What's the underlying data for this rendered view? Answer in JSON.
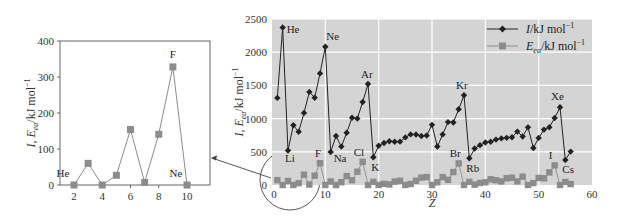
{
  "chart_data": [
    {
      "id": "main",
      "type": "line",
      "title": "",
      "xlabel": "Z",
      "ylabel": "I, E_ea/kJ mol^-1",
      "xlim": [
        0,
        60
      ],
      "ylim": [
        0,
        2500
      ],
      "xticks": [
        0,
        10,
        20,
        30,
        40,
        50,
        60
      ],
      "yticks": [
        0,
        500,
        1000,
        1500,
        2000,
        2500
      ],
      "grid": true,
      "background": "#d4d4d4",
      "legend_position": "upper right",
      "legend": [
        "I/kJ mol^-1",
        "E_ea/kJ mol^-1"
      ],
      "series": [
        {
          "name": "I/kJ mol^-1",
          "color": "#222222",
          "marker": "diamond",
          "x": [
            1,
            2,
            3,
            4,
            5,
            6,
            7,
            8,
            9,
            10,
            11,
            12,
            13,
            14,
            15,
            16,
            17,
            18,
            19,
            20,
            21,
            22,
            23,
            24,
            25,
            26,
            27,
            28,
            29,
            30,
            31,
            32,
            33,
            34,
            35,
            36,
            37,
            38,
            39,
            40,
            41,
            42,
            43,
            44,
            45,
            46,
            47,
            48,
            49,
            50,
            51,
            52,
            53,
            54,
            55,
            56
          ],
          "values": [
            1312,
            2372,
            520,
            900,
            801,
            1086,
            1402,
            1314,
            1681,
            2081,
            496,
            738,
            578,
            786,
            1012,
            1000,
            1251,
            1521,
            419,
            590,
            633,
            659,
            651,
            653,
            717,
            762,
            760,
            737,
            746,
            906,
            579,
            762,
            947,
            941,
            1140,
            1351,
            403,
            549,
            600,
            640,
            652,
            684,
            702,
            710,
            720,
            804,
            731,
            868,
            558,
            709,
            834,
            869,
            1008,
            1170,
            376,
            503
          ]
        },
        {
          "name": "E_ea/kJ mol^-1",
          "color": "#8c8c8c",
          "marker": "square",
          "x": [
            1,
            2,
            3,
            4,
            5,
            6,
            7,
            8,
            9,
            10,
            11,
            12,
            13,
            14,
            15,
            16,
            17,
            18,
            19,
            20,
            21,
            22,
            23,
            24,
            25,
            26,
            27,
            28,
            29,
            30,
            31,
            32,
            33,
            34,
            35,
            36,
            37,
            38,
            39,
            40,
            41,
            42,
            43,
            44,
            45,
            46,
            47,
            48,
            49,
            50,
            51,
            52,
            53,
            54,
            55,
            56
          ],
          "values": [
            73,
            0,
            60,
            0,
            27,
            154,
            7,
            141,
            328,
            0,
            53,
            0,
            42,
            134,
            72,
            200,
            349,
            0,
            48,
            2,
            18,
            8,
            51,
            64,
            0,
            15,
            64,
            112,
            119,
            0,
            41,
            119,
            78,
            195,
            325,
            0,
            47,
            5,
            30,
            41,
            86,
            72,
            53,
            101,
            110,
            54,
            126,
            0,
            29,
            107,
            101,
            190,
            295,
            0,
            46,
            14
          ]
        }
      ],
      "annotations": [
        {
          "text": "He",
          "x": 2,
          "series": "I"
        },
        {
          "text": "Ne",
          "x": 10,
          "series": "I"
        },
        {
          "text": "Ar",
          "x": 18,
          "series": "I"
        },
        {
          "text": "Kr",
          "x": 36,
          "series": "I"
        },
        {
          "text": "Xe",
          "x": 54,
          "series": "I"
        },
        {
          "text": "Li",
          "x": 3,
          "series": "I"
        },
        {
          "text": "Na",
          "x": 11,
          "series": "I"
        },
        {
          "text": "K",
          "x": 19,
          "series": "I"
        },
        {
          "text": "Rb",
          "x": 37,
          "series": "I"
        },
        {
          "text": "Cs",
          "x": 55,
          "series": "I"
        },
        {
          "text": "F",
          "x": 9,
          "series": "E_ea"
        },
        {
          "text": "Cl",
          "x": 17,
          "series": "E_ea"
        },
        {
          "text": "Br",
          "x": 35,
          "series": "E_ea"
        },
        {
          "text": "I",
          "x": 53,
          "series": "E_ea"
        }
      ]
    },
    {
      "id": "inset",
      "type": "line",
      "title": "",
      "xlabel": "",
      "ylabel": "I, E_ea/kJ mol^-1",
      "xlim": [
        1,
        11.2
      ],
      "ylim": [
        0,
        400
      ],
      "xticks": [
        2,
        4,
        6,
        8,
        10
      ],
      "yticks": [
        0,
        100,
        200,
        300,
        400
      ],
      "grid": false,
      "series": [
        {
          "name": "E_ea/kJ mol^-1",
          "color": "#8c8c8c",
          "marker": "square",
          "x": [
            2,
            3,
            4,
            5,
            6,
            7,
            8,
            9,
            10
          ],
          "values": [
            0,
            60,
            0,
            27,
            154,
            7,
            141,
            328,
            0
          ]
        }
      ],
      "annotations": [
        {
          "text": "He",
          "x": 2
        },
        {
          "text": "F",
          "x": 9
        },
        {
          "text": "Ne",
          "x": 10
        }
      ]
    }
  ],
  "labels": {
    "main_xlabel": "Z",
    "ylabel_prefix": "I, E",
    "ylabel_sub": "ea",
    "ylabel_suffix": "/kJ mol",
    "ylabel_sup": "−1",
    "legend_I_main": "I",
    "legend_I_rest": "/kJ mol",
    "legend_E_main": "E",
    "legend_E_sub": "ea",
    "legend_E_rest": "/kJ mol",
    "legend_sup": "−1"
  }
}
